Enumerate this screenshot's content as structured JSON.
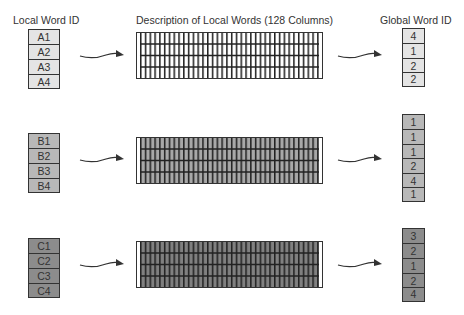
{
  "headers": {
    "local": "Local Word ID",
    "description": "Description of Local Words (128 Columns)",
    "global": "Global Word ID"
  },
  "groups": [
    {
      "name": "A",
      "fill": "#e4e4e4",
      "local_ids": [
        "A1",
        "A2",
        "A3",
        "A4"
      ],
      "grid_fill": "#ffffff",
      "global_ids": [
        "4",
        "1",
        "2",
        "2"
      ]
    },
    {
      "name": "B",
      "fill": "#b8b8b8",
      "local_ids": [
        "B1",
        "B2",
        "B3",
        "B4"
      ],
      "grid_fill": "#a8a8a8",
      "global_ids": [
        "1",
        "1",
        "1",
        "2",
        "4",
        "1"
      ]
    },
    {
      "name": "C",
      "fill": "#8c8c8c",
      "local_ids": [
        "C1",
        "C2",
        "C3",
        "C4"
      ],
      "grid_fill": "#808080",
      "global_ids": [
        "3",
        "2",
        "1",
        "2",
        "4"
      ]
    }
  ],
  "colors": {
    "stroke": "#333333"
  }
}
